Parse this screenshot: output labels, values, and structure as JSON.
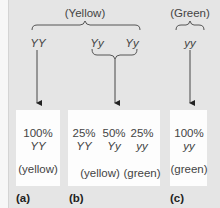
{
  "figure": {
    "top": {
      "yellow_group_label": "(Yellow)",
      "green_group_label": "(Green)",
      "genotypes": [
        "YY",
        "Yy",
        "Yy",
        "yy"
      ]
    },
    "panels": [
      {
        "id": "a",
        "label": "(a)",
        "results": [
          {
            "percent": "100%",
            "genotype": "YY"
          }
        ],
        "phenotypes": [
          "(yellow)"
        ]
      },
      {
        "id": "b",
        "label": "(b)",
        "results": [
          {
            "percent": "25%",
            "genotype": "YY"
          },
          {
            "percent": "50%",
            "genotype": "Yy"
          },
          {
            "percent": "25%",
            "genotype": "yy"
          }
        ],
        "phenotypes": [
          "(yellow)",
          "(green)"
        ]
      },
      {
        "id": "c",
        "label": "(c)",
        "results": [
          {
            "percent": "100%",
            "genotype": "yy"
          }
        ],
        "phenotypes": [
          "(green)"
        ]
      }
    ],
    "colors": {
      "background": "#e5e5e5",
      "box": "#fdfdfd",
      "line": "#333333",
      "text": "#444444"
    }
  }
}
